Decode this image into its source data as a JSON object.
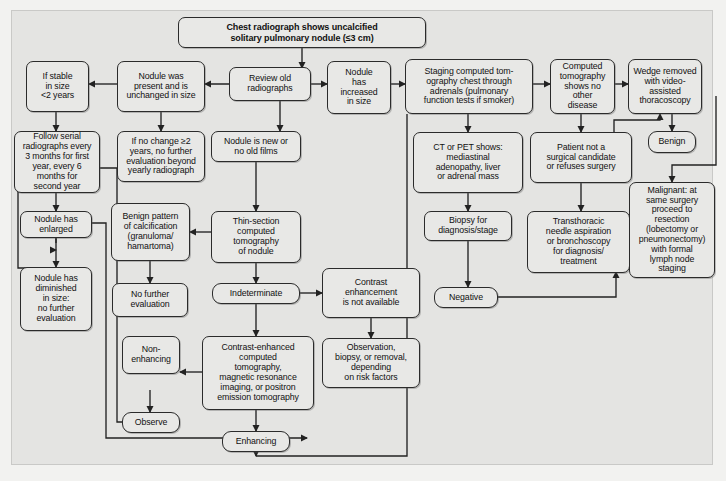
{
  "figure": {
    "type": "flowchart",
    "background_color": "#e4e4e2",
    "node_fill": "#e8e8e6",
    "node_stroke": "#2b2b2b"
  },
  "nodes": {
    "start": "Chest radiograph shows uncalcified solitary pulmonary nodule (≤3 cm)",
    "if_stable": "If stable in size <2 years",
    "nodule_present_unchanged": "Nodule was present and is unchanged in size",
    "review_old": "Review old radiographs",
    "nodule_increased": "Nodule has increased in size",
    "staging_ct": "Staging computed tomography chest through adrenals (pulmonary function tests if smoker)",
    "ct_no_other_disease": "Computed tomography shows no other disease",
    "wedge_removed": "Wedge removed with video-assisted thoracoscopy",
    "follow_serial": "Follow serial radiographs every 3 months for first year, every 6 months for second year",
    "no_change_2y": "If no change ≥2 years, no further evaluation beyond yearly radiograph",
    "nodule_new": "Nodule is new or no old films",
    "ct_pet_shows": "CT or PET shows: mediastinal adenopathy, liver or adrenal mass",
    "not_surgical_candidate": "Patient not a surgical candidate or refuses surgery",
    "benign": "Benign",
    "nodule_enlarged": "Nodule has enlarged",
    "benign_pattern": "Benign pattern of calcification (granuloma/ hamartoma)",
    "thin_section_ct": "Thin-section computed tomography of nodule",
    "biopsy_for_dx": "Biopsy for diagnosis/stage",
    "transthoracic": "Transthoracic needle aspiration or bronchoscopy for diagnosis/ treatment",
    "malignant": "Malignant: at same surgery proceed to resection (lobectomy or pneumonectomy) with formal lymph node staging",
    "nodule_diminished": "Nodule has diminished in size: no further evaluation",
    "no_further_eval": "No further evaluation",
    "indeterminate": "Indeterminate",
    "contrast_unavailable": "Contrast enhancement is not available",
    "negative": "Negative",
    "non_enhancing": "Non- enhancing",
    "contrast_enhanced": "Contrast-enhanced computed tomography, magnetic resonance imaging, or positron emission tomography",
    "observation_biopsy": "Observation, biopsy, or removal, depending on risk factors",
    "observe": "Observe",
    "enhancing": "Enhancing"
  },
  "node_lines": {
    "start": [
      "Chest radiograph shows uncalcified",
      "solitary pulmonary nodule (≤3 cm)"
    ],
    "if_stable": [
      "If stable",
      "in size",
      "<2 years"
    ],
    "nodule_present_unchanged": [
      "Nodule was",
      "present and is",
      "unchanged in size"
    ],
    "review_old": [
      "Review old",
      "radiographs"
    ],
    "nodule_increased": [
      "Nodule",
      "has",
      "increased",
      "in size"
    ],
    "staging_ct": [
      "Staging computed tom-",
      "ography chest through",
      "adrenals (pulmonary",
      "function tests if smoker)"
    ],
    "ct_no_other_disease": [
      "Computed",
      "tomography",
      "shows no other",
      "disease"
    ],
    "wedge_removed": [
      "Wedge removed",
      "with video-",
      "assisted",
      "thoracoscopy"
    ],
    "follow_serial": [
      "Follow serial",
      "radiographs every",
      "3 months for first",
      "year, every 6",
      "months for",
      "second year"
    ],
    "no_change_2y": [
      "If no change ≥2",
      "years, no further",
      "evaluation beyond",
      "yearly radiograph"
    ],
    "nodule_new": [
      "Nodule is new or",
      "no old films"
    ],
    "ct_pet_shows": [
      "CT or PET shows:",
      "mediastinal",
      "adenopathy, liver",
      "or adrenal mass"
    ],
    "not_surgical_candidate": [
      "Patient not a",
      "surgical candidate",
      "or refuses surgery"
    ],
    "benign": [
      "Benign"
    ],
    "nodule_enlarged": [
      "Nodule has",
      "enlarged"
    ],
    "benign_pattern": [
      "Benign pattern",
      "of calcification",
      "(granuloma/",
      "hamartoma)"
    ],
    "thin_section_ct": [
      "Thin-section",
      "computed",
      "tomography",
      "of nodule"
    ],
    "biopsy_for_dx": [
      "Biopsy for",
      "diagnosis/stage"
    ],
    "transthoracic": [
      "Transthoracic",
      "needle aspiration",
      "or bronchoscopy",
      "for diagnosis/",
      "treatment"
    ],
    "malignant": [
      "Malignant: at",
      "same surgery",
      "proceed to",
      "resection",
      "(lobectomy or",
      "pneumonectomy)",
      "with formal",
      "lymph node",
      "staging"
    ],
    "nodule_diminished": [
      "Nodule has",
      "diminished",
      "in size:",
      "no further",
      "evaluation"
    ],
    "no_further_eval": [
      "No further",
      "evaluation"
    ],
    "indeterminate": [
      "Indeterminate"
    ],
    "contrast_unavailable": [
      "Contrast",
      "enhancement",
      "is not available"
    ],
    "negative": [
      "Negative"
    ],
    "non_enhancing": [
      "Non-",
      "enhancing"
    ],
    "contrast_enhanced": [
      "Contrast-enhanced",
      "computed",
      "tomography,",
      "magnetic resonance",
      "imaging, or positron",
      "emission tomography"
    ],
    "observation_biopsy": [
      "Observation,",
      "biopsy, or removal,",
      "depending",
      "on risk factors"
    ],
    "observe": [
      "Observe"
    ],
    "enhancing": [
      "Enhancing"
    ]
  },
  "edges": [
    {
      "from": "start",
      "to": "review_old"
    },
    {
      "from": "nodule_present_unchanged",
      "to": "if_stable"
    },
    {
      "from": "review_old",
      "to": "nodule_present_unchanged"
    },
    {
      "from": "review_old",
      "to": "nodule_increased"
    },
    {
      "from": "review_old",
      "to": "nodule_new"
    },
    {
      "from": "nodule_increased",
      "to": "staging_ct"
    },
    {
      "from": "staging_ct",
      "to": "ct_no_other_disease"
    },
    {
      "from": "staging_ct",
      "to": "ct_pet_shows"
    },
    {
      "from": "ct_no_other_disease",
      "to": "wedge_removed"
    },
    {
      "from": "ct_no_other_disease",
      "to": "not_surgical_candidate"
    },
    {
      "from": "if_stable",
      "to": "follow_serial"
    },
    {
      "from": "nodule_present_unchanged",
      "to": "no_change_2y"
    },
    {
      "from": "nodule_new",
      "to": "thin_section_ct"
    },
    {
      "from": "ct_pet_shows",
      "to": "biopsy_for_dx"
    },
    {
      "from": "not_surgical_candidate",
      "to": "transthoracic"
    },
    {
      "from": "wedge_removed",
      "to": "benign"
    },
    {
      "from": "wedge_removed",
      "to": "malignant"
    },
    {
      "from": "follow_serial",
      "to": "nodule_enlarged"
    },
    {
      "from": "nodule_enlarged",
      "to": "nodule_diminished"
    },
    {
      "from": "thin_section_ct",
      "to": "benign_pattern"
    },
    {
      "from": "thin_section_ct",
      "to": "indeterminate"
    },
    {
      "from": "benign_pattern",
      "to": "no_further_eval"
    },
    {
      "from": "indeterminate",
      "to": "contrast_unavailable"
    },
    {
      "from": "indeterminate",
      "to": "contrast_enhanced"
    },
    {
      "from": "contrast_unavailable",
      "to": "observation_biopsy"
    },
    {
      "from": "biopsy_for_dx",
      "to": "negative"
    },
    {
      "from": "negative",
      "to": "transthoracic"
    },
    {
      "from": "contrast_enhanced",
      "to": "non_enhancing"
    },
    {
      "from": "contrast_enhanced",
      "to": "enhancing"
    },
    {
      "from": "non_enhancing",
      "to": "observe"
    },
    {
      "from": "observe",
      "to": "follow_serial"
    },
    {
      "from": "nodule_enlarged",
      "to": "staging_ct"
    },
    {
      "from": "enhancing",
      "to": "staging_ct"
    }
  ]
}
